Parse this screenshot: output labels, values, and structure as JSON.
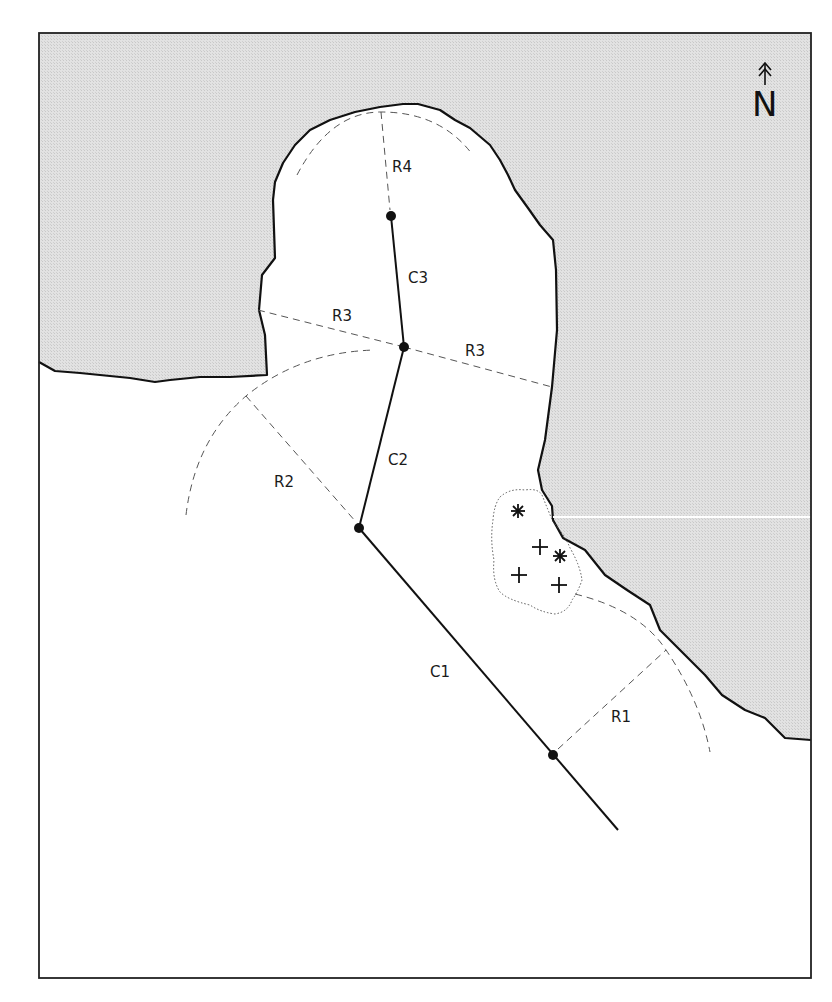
{
  "map": {
    "north_label": "N",
    "colors": {
      "land": "#dcdcdc",
      "water": "#ffffff",
      "coastline": "#111111",
      "dashed": "#555555",
      "frame": "#222222"
    },
    "labels": {
      "c1": "C1",
      "c2": "C2",
      "c3": "C3",
      "r1": "R1",
      "r2": "R2",
      "r3_left": "R3",
      "r3_right": "R3",
      "r4": "R4"
    },
    "centerline_points": [
      {
        "name": "C1-end",
        "x": 553,
        "y": 755
      },
      {
        "name": "C1-C2",
        "x": 359,
        "y": 528
      },
      {
        "name": "C2-C3",
        "x": 404,
        "y": 347
      },
      {
        "name": "C3-end",
        "x": 391,
        "y": 216
      }
    ],
    "markers": [
      {
        "type": "asterisk",
        "x": 518,
        "y": 511
      },
      {
        "type": "plus",
        "x": 540,
        "y": 547
      },
      {
        "type": "asterisk",
        "x": 560,
        "y": 556
      },
      {
        "type": "plus",
        "x": 519,
        "y": 575
      },
      {
        "type": "plus",
        "x": 559,
        "y": 585
      }
    ]
  }
}
